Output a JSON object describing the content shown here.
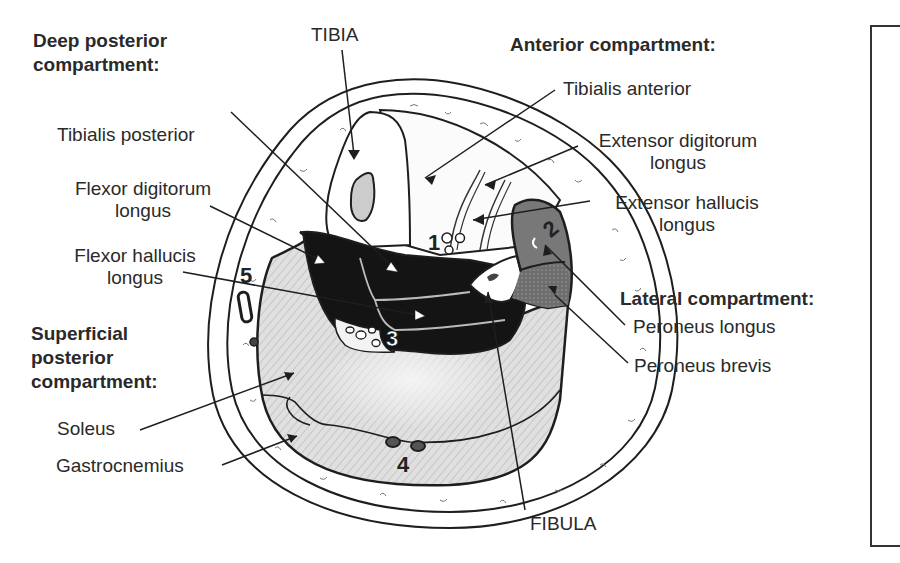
{
  "diagram": {
    "headers": {
      "deep_posterior": [
        "Deep posterior",
        "compartment:"
      ],
      "anterior": "Anterior compartment:",
      "lateral": "Lateral compartment:",
      "superficial_posterior": [
        "Superficial",
        "posterior",
        "compartment:"
      ]
    },
    "bones": {
      "tibia": "TIBIA",
      "fibula": "FIBULA"
    },
    "labels": {
      "tibialis_posterior": "Tibialis posterior",
      "flexor_digitorum_longus": [
        "Flexor digitorum",
        "longus"
      ],
      "flexor_hallucis_longus": [
        "Flexor hallucis",
        "longus"
      ],
      "tibialis_anterior": "Tibialis anterior",
      "extensor_digitorum_longus": [
        "Extensor digitorum",
        "longus"
      ],
      "extensor_hallucis_longus": [
        "Extensor hallucis",
        "longus"
      ],
      "peroneus_longus": "Peroneus longus",
      "peroneus_brevis": "Peroneus brevis",
      "soleus": "Soleus",
      "gastrocnemius": "Gastrocnemius"
    },
    "numbers": [
      "1",
      "2",
      "3",
      "4",
      "5"
    ],
    "colors": {
      "deep_posterior_fill": "#141414",
      "lateral_fill": "#7a7a7a",
      "superficial_fill": "#d9d9d9",
      "outline": "#1e1e1e",
      "background": "#ffffff"
    }
  }
}
